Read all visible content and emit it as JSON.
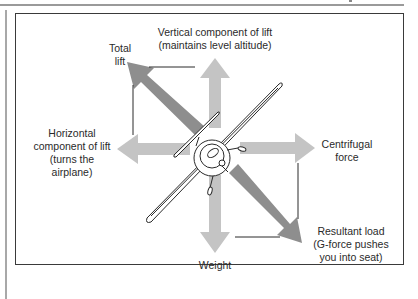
{
  "diagram": {
    "colors": {
      "light_arrow": "#c4c4c4",
      "dark_arrow": "#8e8e8e",
      "frame": "#3a3a3a",
      "text": "#2a2a2a"
    },
    "labels": {
      "vertical_lift": "Vertical component of lift\n(maintains level altitude)",
      "total_lift": "Total\nlift",
      "horizontal_lift": "Horizontal\ncomponent of lift\n(turns the\nairplane)",
      "centrifugal": "Centrifugal\nforce",
      "resultant": "Resultant load\n(G-force pushes\nyou into seat)",
      "weight": "Weight"
    },
    "arrows": [
      {
        "name": "vertical-component-of-lift",
        "direction": "up",
        "shade": "light"
      },
      {
        "name": "total-lift",
        "direction": "up-left",
        "shade": "dark"
      },
      {
        "name": "horizontal-component-of-lift",
        "direction": "left",
        "shade": "light"
      },
      {
        "name": "centrifugal-force",
        "direction": "right",
        "shade": "light"
      },
      {
        "name": "weight",
        "direction": "down",
        "shade": "light"
      },
      {
        "name": "resultant-load",
        "direction": "down-right",
        "shade": "dark"
      }
    ]
  }
}
